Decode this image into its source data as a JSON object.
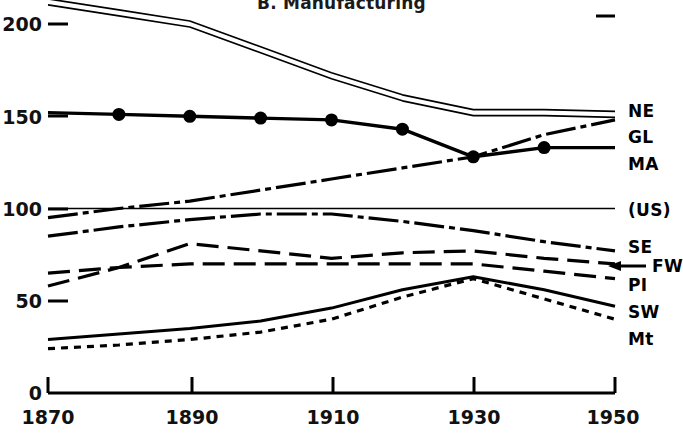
{
  "title": "B. Manufacturing",
  "axes": {
    "y_ticks": [
      "200",
      "150",
      "100",
      "50",
      "0"
    ],
    "x_ticks": [
      "1870",
      "1890",
      "1910",
      "1930",
      "1950"
    ]
  },
  "legend": {
    "ne": "NE",
    "gl": "GL",
    "ma": "MA",
    "us": "(US)",
    "se": "SE",
    "fw": "FW",
    "pi": "PI",
    "sw": "SW",
    "mt": "Mt"
  },
  "chart_data": {
    "type": "line",
    "title": "B. Manufacturing",
    "xlabel": "",
    "ylabel": "",
    "xlim": [
      1870,
      1950
    ],
    "ylim": [
      0,
      215
    ],
    "x_ticks": [
      1870,
      1890,
      1910,
      1930,
      1950
    ],
    "y_ticks": [
      0,
      50,
      100,
      150,
      200
    ],
    "grid": false,
    "legend_position": "right",
    "x": [
      1870,
      1880,
      1890,
      1900,
      1910,
      1920,
      1930,
      1940,
      1950
    ],
    "series": [
      {
        "name": "NE",
        "label": "NE",
        "style": "double-solid",
        "values": [
          212,
          206,
          200,
          186,
          172,
          160,
          152,
          152,
          151
        ]
      },
      {
        "name": "GL",
        "label": "GL",
        "style": "dash-dot",
        "values": [
          95,
          100,
          104,
          110,
          116,
          122,
          128,
          140,
          148
        ]
      },
      {
        "name": "MA",
        "label": "MA",
        "style": "solid-marker",
        "values": [
          152,
          151,
          150,
          149,
          148,
          143,
          128,
          133,
          133
        ]
      },
      {
        "name": "(US)",
        "label": "(US)",
        "style": "thin-solid",
        "values": [
          100,
          100,
          100,
          100,
          100,
          100,
          100,
          100,
          100
        ]
      },
      {
        "name": "SE",
        "label": "SE",
        "style": "dash-dot",
        "values": [
          85,
          90,
          94,
          97,
          97,
          93,
          88,
          82,
          77
        ]
      },
      {
        "name": "FW",
        "label": "FW",
        "style": "long-dash",
        "values": [
          58,
          68,
          81,
          77,
          73,
          76,
          77,
          73,
          70
        ]
      },
      {
        "name": "PI",
        "label": "PI",
        "style": "long-dash",
        "values": [
          65,
          68,
          70,
          70,
          70,
          70,
          70,
          66,
          62
        ]
      },
      {
        "name": "SW",
        "label": "SW",
        "style": "solid",
        "values": [
          29,
          32,
          35,
          39,
          46,
          56,
          63,
          56,
          47
        ]
      },
      {
        "name": "Mt",
        "label": "Mt",
        "style": "short-dash",
        "values": [
          24,
          26,
          29,
          33,
          40,
          52,
          62,
          51,
          40
        ]
      }
    ]
  }
}
